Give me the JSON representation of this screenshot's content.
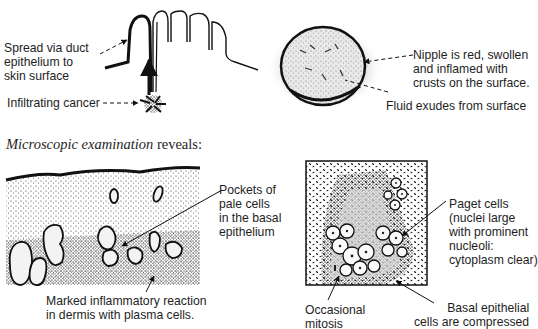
{
  "figure": {
    "top_left": {
      "labels": {
        "spread": [
          "Spread via duct",
          "epithelium to",
          "skin surface"
        ],
        "infiltrating": "Infiltrating cancer"
      }
    },
    "top_right": {
      "labels": {
        "nipple": [
          "Nipple is red, swollen",
          "and inflamed with",
          "crusts on the surface."
        ],
        "fluid": "Fluid exudes from surface"
      }
    },
    "section_heading": {
      "italic": "Microscopic examination",
      "rest": " reveals:"
    },
    "bottom_left": {
      "labels": {
        "pockets": [
          "Pockets of",
          "pale cells",
          "in the basal",
          "epithelium"
        ],
        "inflammatory": [
          "Marked inflammatory reaction",
          "in dermis with plasma cells."
        ]
      }
    },
    "bottom_right": {
      "labels": {
        "paget": [
          "Paget cells",
          "(nuclei large",
          "with prominent",
          "nucleoli:",
          "cytoplasm clear)"
        ],
        "mitosis": [
          "Occasional",
          "mitosis"
        ],
        "basal": [
          "Basal epithelial",
          "cells are compressed"
        ]
      }
    }
  }
}
